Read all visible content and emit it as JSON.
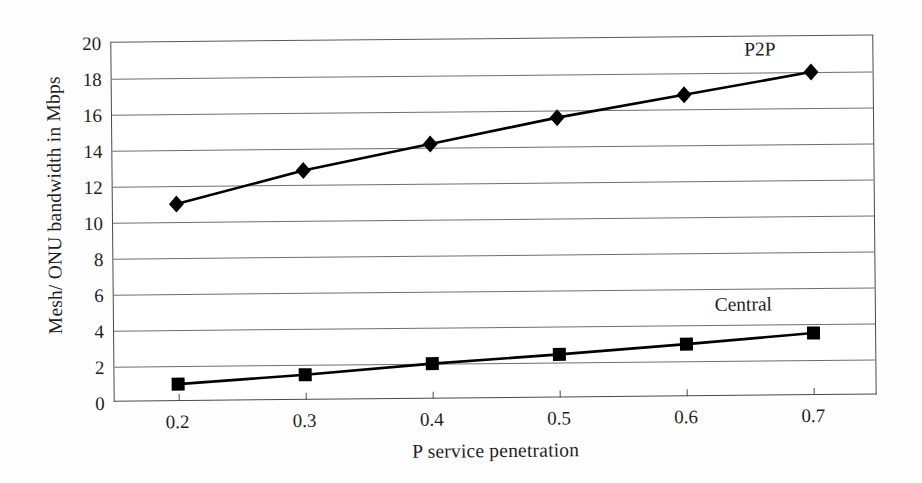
{
  "chart_data": {
    "type": "line",
    "title": "",
    "xlabel": "P service penetration",
    "ylabel": "Mesh/ ONU bandwidth in Mbps",
    "x": [
      0.2,
      0.3,
      0.4,
      0.5,
      0.6,
      0.7
    ],
    "xtick_labels": [
      "0.2",
      "0.3",
      "0.4",
      "0.5",
      "0.6",
      "0.7"
    ],
    "ytick_labels": [
      "0",
      "2",
      "4",
      "6",
      "8",
      "10",
      "12",
      "14",
      "16",
      "18",
      "20"
    ],
    "yticks": [
      0,
      2,
      4,
      6,
      8,
      10,
      12,
      14,
      16,
      18,
      20
    ],
    "ylim": [
      0,
      20
    ],
    "xlim": [
      0.15,
      0.75
    ],
    "grid": true,
    "legend": "inline-annotations",
    "series": [
      {
        "name": "P2P",
        "marker": "diamond",
        "color": "#000000",
        "values": [
          11.0,
          12.8,
          14.2,
          15.6,
          16.8,
          18.0
        ],
        "annotation": {
          "text": "P2P",
          "x": 0.66,
          "y": 19.3
        }
      },
      {
        "name": "Central",
        "marker": "square",
        "color": "#000000",
        "values": [
          1.0,
          1.45,
          2.0,
          2.45,
          2.95,
          3.5
        ],
        "annotation": {
          "text": "Central",
          "x": 0.645,
          "y": 5.1
        }
      }
    ]
  },
  "axes": {
    "x_title": "P service penetration",
    "y_title": "Mesh/ ONU bandwidth in Mbps"
  },
  "annotations": {
    "p2p_label": "P2P",
    "central_label": "Central"
  },
  "colors": {
    "line": "#000000",
    "grid": "#6e6e6e",
    "frame": "#4a4a4a",
    "background": "#ffffff",
    "text": "#1f1f1f"
  }
}
